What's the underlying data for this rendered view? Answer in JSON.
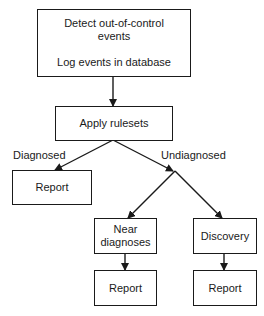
{
  "nodes": {
    "detect": {
      "line1": "Detect out-of-control",
      "line2": "events",
      "line3": "Log events in database"
    },
    "apply": {
      "label": "Apply rulesets"
    },
    "report_diagnosed": {
      "label": "Report"
    },
    "near": {
      "line1": "Near",
      "line2": "diagnoses"
    },
    "discovery": {
      "label": "Discovery"
    },
    "report_near": {
      "label": "Report"
    },
    "report_discovery": {
      "label": "Report"
    }
  },
  "edge_labels": {
    "diagnosed": "Diagnosed",
    "undiagnosed": "Undiagnosed"
  },
  "colors": {
    "stroke": "#1a1a1a",
    "background": "#ffffff"
  }
}
